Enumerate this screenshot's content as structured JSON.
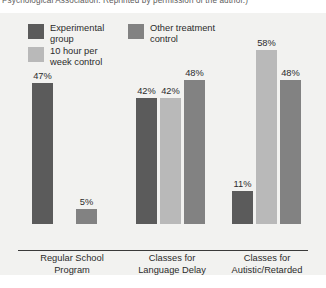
{
  "caption": {
    "text": "Psychological Association. Reprinted by permission of the author.)"
  },
  "legend": {
    "entries": [
      {
        "label": "Experimental\ngroup",
        "color": "#5b5b5b",
        "key": "experimental-group"
      },
      {
        "label": "Other treatment\ncontrol",
        "color": "#828282",
        "key": "other-treatment-control"
      },
      {
        "label": "10 hour per\nweek control",
        "color": "#b9b9b9",
        "key": "10-hour-per-week-control"
      }
    ]
  },
  "chart_data": {
    "type": "bar",
    "title": "",
    "xlabel": "",
    "ylabel": "",
    "ylim": [
      0,
      62
    ],
    "grid": false,
    "legend_position": "top-left",
    "categories": [
      "Regular School\nProgram",
      "Classes for\nLanguage Delay",
      "Classes for\nAutistic/Retarded"
    ],
    "series": [
      {
        "name": "Experimental group",
        "color": "#5b5b5b",
        "values": [
          47,
          42,
          11
        ]
      },
      {
        "name": "10 hour per week control",
        "color": "#b9b9b9",
        "values": [
          null,
          42,
          58
        ]
      },
      {
        "name": "Other treatment control",
        "color": "#828282",
        "values": [
          5,
          48,
          48
        ]
      }
    ],
    "bars": [
      {
        "group": 0,
        "series": "Experimental group",
        "value": 47,
        "label": "47%",
        "color": "#5b5b5b",
        "x": 32,
        "w": 21
      },
      {
        "group": 0,
        "series": "Other treatment control",
        "value": 5,
        "label": "5%",
        "color": "#828282",
        "x": 76,
        "w": 21
      },
      {
        "group": 1,
        "series": "Experimental group",
        "value": 42,
        "label": "42%",
        "color": "#5b5b5b",
        "x": 136,
        "w": 21
      },
      {
        "group": 1,
        "series": "10 hour per week control",
        "value": 42,
        "label": "42%",
        "color": "#b9b9b9",
        "x": 160,
        "w": 21
      },
      {
        "group": 1,
        "series": "Other treatment control",
        "value": 48,
        "label": "48%",
        "color": "#828282",
        "x": 184,
        "w": 21
      },
      {
        "group": 2,
        "series": "Experimental group",
        "value": 11,
        "label": "11%",
        "color": "#5b5b5b",
        "x": 232,
        "w": 21
      },
      {
        "group": 2,
        "series": "10 hour per week control",
        "value": 58,
        "label": "58%",
        "color": "#b9b9b9",
        "x": 256,
        "w": 21
      },
      {
        "group": 2,
        "series": "Other treatment control",
        "value": 48,
        "label": "48%",
        "color": "#828282",
        "x": 280,
        "w": 21
      }
    ],
    "group_labels": [
      {
        "text": "Regular School\nProgram",
        "left": 18,
        "width": 108
      },
      {
        "text": "Classes for\nLanguage Delay",
        "left": 120,
        "width": 104
      },
      {
        "text": "Classes for\nAutistic/Retarded",
        "left": 212,
        "width": 110
      }
    ]
  }
}
